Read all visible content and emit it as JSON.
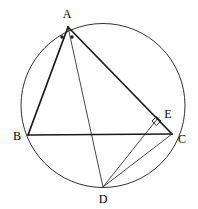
{
  "figure": {
    "type": "euclidean-geometry-diagram",
    "stroke_color": "#1a1a1a",
    "thin_stroke_color": "#333333",
    "background_color": "#ffffff",
    "canvas": {
      "width": 198,
      "height": 209
    }
  },
  "circle": {
    "name": "circumcircle",
    "cx": 103,
    "cy": 105.5,
    "r": 82,
    "stroke_width": 0.9
  },
  "points": {
    "A": {
      "label": "A",
      "x": 68,
      "y": 27,
      "label_x": 67,
      "label_y": 14
    },
    "B": {
      "label": "B",
      "x": 28,
      "y": 135,
      "label_x": 17,
      "label_y": 136
    },
    "C": {
      "label": "C",
      "x": 172,
      "y": 134,
      "label_x": 182,
      "label_y": 139
    },
    "D": {
      "label": "D",
      "x": 103,
      "y": 187,
      "label_x": 103,
      "label_y": 199
    },
    "E": {
      "label": "E",
      "x": 158,
      "y": 118,
      "label_x": 168,
      "label_y": 114
    }
  },
  "segments": [
    {
      "name": "segment-AB",
      "from": "A",
      "to": "B",
      "width": 1.6
    },
    {
      "name": "segment-AC",
      "from": "A",
      "to": "C",
      "width": 1.6
    },
    {
      "name": "segment-BC",
      "from": "B",
      "to": "C",
      "width": 1.6
    },
    {
      "name": "segment-AD",
      "from": "A",
      "to": "D",
      "width": 0.9
    },
    {
      "name": "segment-DC",
      "from": "D",
      "to": "C",
      "width": 0.9
    },
    {
      "name": "segment-DE",
      "from": "D",
      "to": "E",
      "width": 0.9
    }
  ],
  "marks": {
    "angle_bisector_dots": {
      "name": "equal-angle-dots",
      "count": 2,
      "radius": 1.6,
      "positions": [
        {
          "x": 62,
          "y": 37
        },
        {
          "x": 72,
          "y": 37
        }
      ]
    },
    "right_angle": {
      "name": "right-angle-marker-at-E",
      "vertex_x": 152,
      "vertex_y": 121,
      "size": 7,
      "at_point": "E"
    }
  }
}
